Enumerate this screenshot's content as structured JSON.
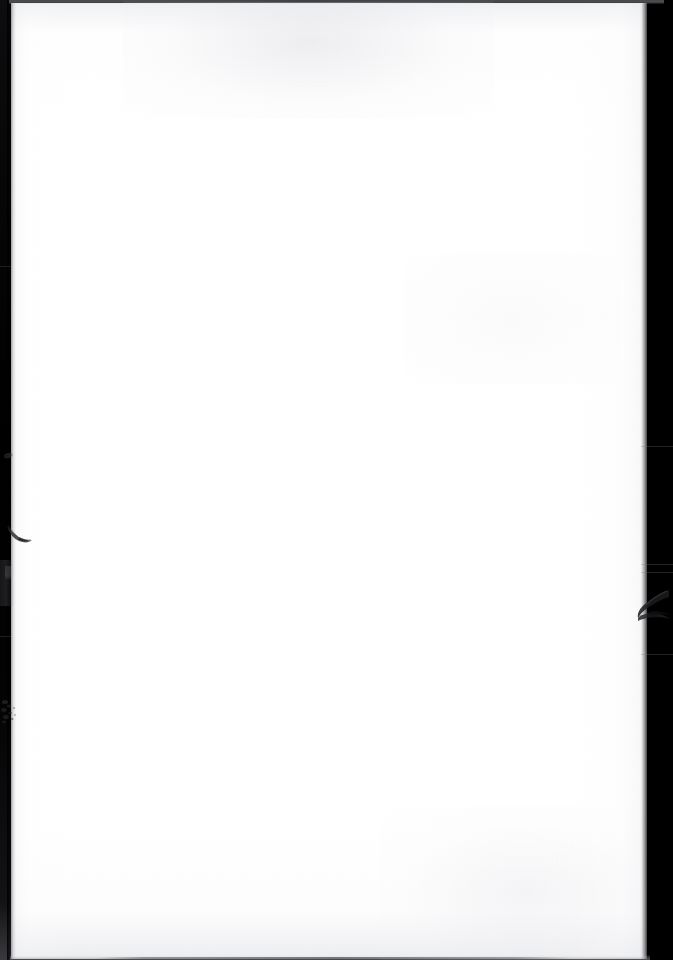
{
  "document": {
    "kind": "scanned-page",
    "content_text": "",
    "content_note": "blank page",
    "page_width_px": 673,
    "page_height_px": 960
  },
  "page": {
    "paper_color": "#ffffff",
    "surround_color": "#000000",
    "paper_left_px": 8,
    "paper_top_px": 3,
    "paper_width_px": 639,
    "paper_height_px": 956
  },
  "surround": {
    "left_band": {
      "name": "left-scanner-gutter",
      "color": "#000000",
      "width_px": 11
    },
    "right_band": {
      "name": "right-scanner-bed",
      "color": "#000000",
      "width_px": 30
    },
    "top_rule": {
      "name": "top-page-edge-shadow",
      "color": "#4a4b50",
      "height_px": 4
    },
    "bottom_rule": {
      "name": "bottom-page-edge-shadow",
      "color": "#55565c",
      "height_px": 5
    }
  },
  "artifacts": [
    {
      "name": "dot-speck-left-margin",
      "kind": "speck",
      "x_px": 4,
      "y_px": 453,
      "width_px": 9,
      "height_px": 5,
      "color": "#18181b"
    },
    {
      "name": "hair-fiber-left-edge",
      "kind": "fiber",
      "x_px": 6,
      "y_px": 524,
      "width_px": 30,
      "height_px": 30,
      "color": "#2b2c30"
    },
    {
      "name": "smear-left-margin",
      "kind": "smear",
      "x_px": 0,
      "y_px": 560,
      "width_px": 14,
      "height_px": 46,
      "color": "#28282c"
    },
    {
      "name": "speckle-cluster-lower-left",
      "kind": "speckle",
      "x_px": 1,
      "y_px": 697,
      "width_px": 24,
      "height_px": 30,
      "color": "#232326"
    },
    {
      "name": "tear-fold-right-edge",
      "kind": "tear",
      "x_px": 631,
      "y_px": 588,
      "width_px": 42,
      "height_px": 50,
      "color": "#1c1c1f"
    }
  ]
}
